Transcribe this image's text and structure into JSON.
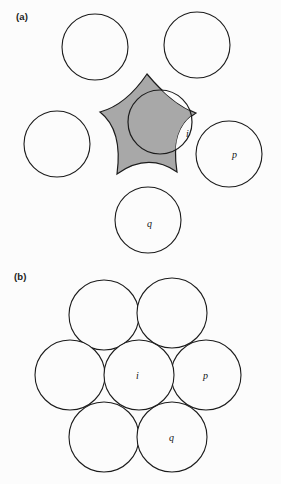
{
  "figure": {
    "background_color": "#fcfcfc",
    "stroke_color": "#1c1c1c",
    "shade_color": "#a8a8a8",
    "width": 281,
    "height": 484
  },
  "panels": [
    {
      "id": "a",
      "label": "(a)",
      "description": "Five separated circles around a shaded concave star-shaped region overlapping circle i",
      "circle_radius": 33,
      "circles": [
        {
          "name": "top-left",
          "cx": 95,
          "cy": 47,
          "r": 33,
          "label": ""
        },
        {
          "name": "top-right",
          "cx": 197,
          "cy": 45,
          "r": 33,
          "label": ""
        },
        {
          "name": "left",
          "cx": 57,
          "cy": 144,
          "r": 33,
          "label": ""
        },
        {
          "name": "right",
          "cx": 229,
          "cy": 154,
          "r": 33,
          "label": "p"
        },
        {
          "name": "bottom",
          "cx": 148,
          "cy": 220,
          "r": 33,
          "label": "q"
        },
        {
          "name": "center-i",
          "cx": 160,
          "cy": 122,
          "r": 32,
          "label": "i"
        }
      ],
      "shaded_region": {
        "name": "voronoi-star",
        "fill": "#a8a8a8",
        "points": 5,
        "cusps": [
          {
            "x": 147,
            "y": 74
          },
          {
            "x": 196,
            "y": 113
          },
          {
            "x": 177,
            "y": 172
          },
          {
            "x": 117,
            "y": 174
          },
          {
            "x": 100,
            "y": 112
          }
        ]
      },
      "labels": [
        {
          "text": "i",
          "x": 186,
          "y": 137
        },
        {
          "text": "p",
          "x": 232,
          "y": 158
        },
        {
          "text": "q",
          "x": 147,
          "y": 227
        }
      ]
    },
    {
      "id": "b",
      "label": "(b)",
      "description": "Seven mutually tangent equal circles in hexagonal close packing",
      "circle_radius": 35,
      "circles": [
        {
          "name": "upper-left",
          "cx": 104,
          "cy": 315,
          "r": 35,
          "label": ""
        },
        {
          "name": "upper-right",
          "cx": 172,
          "cy": 313,
          "r": 35,
          "label": ""
        },
        {
          "name": "mid-left",
          "cx": 70,
          "cy": 375,
          "r": 35,
          "label": ""
        },
        {
          "name": "center-i",
          "cx": 139,
          "cy": 375,
          "r": 35,
          "label": "i"
        },
        {
          "name": "mid-right",
          "cx": 206,
          "cy": 375,
          "r": 35,
          "label": "p"
        },
        {
          "name": "lower-left",
          "cx": 104,
          "cy": 437,
          "r": 35,
          "label": ""
        },
        {
          "name": "lower-right",
          "cx": 172,
          "cy": 437,
          "r": 35,
          "label": "q"
        }
      ],
      "labels": [
        {
          "text": "i",
          "x": 136,
          "y": 379
        },
        {
          "text": "p",
          "x": 203,
          "y": 379
        },
        {
          "text": "q",
          "x": 169,
          "y": 441
        }
      ]
    }
  ]
}
